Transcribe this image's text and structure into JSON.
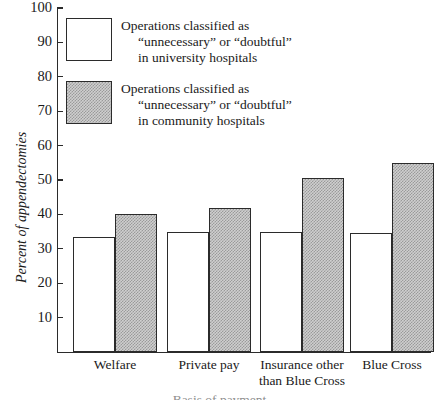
{
  "chart_data": {
    "type": "bar",
    "title": "",
    "xlabel": "Basis of payment",
    "ylabel": "Percent of appendectomies",
    "ylim": [
      0,
      100
    ],
    "yticks": [
      10,
      20,
      30,
      40,
      50,
      60,
      70,
      80,
      90,
      100
    ],
    "grid": false,
    "legend_position": "upper-left-inside",
    "categories": [
      "Welfare",
      "Private pay",
      "Insurance other than Blue Cross",
      "Blue Cross"
    ],
    "category_lines": [
      [
        "Welfare"
      ],
      [
        "Private pay"
      ],
      [
        "Insurance other",
        "than Blue Cross"
      ],
      [
        "Blue Cross"
      ]
    ],
    "series": [
      {
        "name": "Operations classified as “unnecessary” or “doubtful” in university hospitals",
        "fill": "open",
        "values": [
          33.5,
          35,
          35,
          34.5
        ]
      },
      {
        "name": "Operations classified as “unnecessary” or “doubtful” in community hospitals",
        "fill": "shaded",
        "values": [
          40,
          42,
          50.5,
          55
        ]
      }
    ]
  },
  "legend": {
    "entries": [
      {
        "swatch": "open",
        "line1": "Operations classified as",
        "line2": "“unnecessary” or “doubtful”",
        "line3": "in university hospitals"
      },
      {
        "swatch": "shaded",
        "line1": "Operations classified as",
        "line2": "“unnecessary” or “doubtful”",
        "line3": "in community hospitals"
      }
    ]
  },
  "axis": {
    "y_title": "Percent of appendectomies",
    "x_title_cropped": "Basis of payment"
  }
}
